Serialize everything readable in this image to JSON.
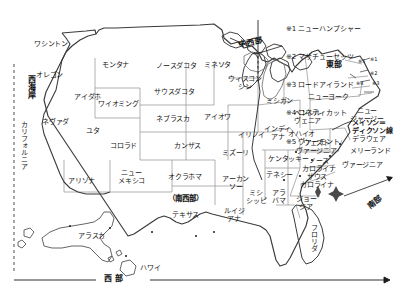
{
  "map": {
    "title_alt": "アメリカ合衆国州地図",
    "legend": {
      "marker_symbol": "※",
      "items": [
        {
          "num": "1",
          "label": "ニューハンプシャー"
        },
        {
          "num": "2",
          "label": "マサチューセッツ"
        },
        {
          "num": "3",
          "label": "ロードアイランド"
        },
        {
          "num": "4",
          "label": "コネティカット"
        },
        {
          "num": "5",
          "label": "ヴァーモント"
        }
      ]
    },
    "regions": [
      {
        "name": "west-coast",
        "label": "西海岸"
      },
      {
        "name": "midwest",
        "label": "中西部"
      },
      {
        "name": "east",
        "label": "東部"
      },
      {
        "name": "southwest",
        "label": "（南西部）"
      },
      {
        "name": "south",
        "label": "南部"
      },
      {
        "name": "west",
        "label": "西部"
      }
    ],
    "annotations": [
      {
        "name": "mason-dixon-line",
        "label": "メイソン＝\nディクソン線"
      }
    ],
    "states": [
      {
        "name": "washington",
        "label": "ワシントン"
      },
      {
        "name": "oregon",
        "label": "オレゴン"
      },
      {
        "name": "idaho",
        "label": "アイダホ"
      },
      {
        "name": "nevada",
        "label": "ネヴァダ"
      },
      {
        "name": "california",
        "label": "カリフォルニア"
      },
      {
        "name": "utah",
        "label": "ユタ"
      },
      {
        "name": "arizona",
        "label": "アリゾナ"
      },
      {
        "name": "montana",
        "label": "モンタナ"
      },
      {
        "name": "wyoming",
        "label": "ワイオミング"
      },
      {
        "name": "colorado",
        "label": "コロラド"
      },
      {
        "name": "new-mexico",
        "label": "ニュー\nメキシコ"
      },
      {
        "name": "north-dakota",
        "label": "ノースダコタ"
      },
      {
        "name": "south-dakota",
        "label": "サウスダコタ"
      },
      {
        "name": "nebraska",
        "label": "ネブラスカ"
      },
      {
        "name": "kansas",
        "label": "カンザス"
      },
      {
        "name": "oklahoma",
        "label": "オクラホマ"
      },
      {
        "name": "texas",
        "label": "テキサス"
      },
      {
        "name": "minnesota",
        "label": "ミネソタ"
      },
      {
        "name": "iowa",
        "label": "アイオワ"
      },
      {
        "name": "missouri",
        "label": "ミズーリ"
      },
      {
        "name": "arkansas",
        "label": "アーカン\nソー"
      },
      {
        "name": "louisiana",
        "label": "ルイジ\nアナ"
      },
      {
        "name": "wisconsin",
        "label": "ウィスコン\nシン"
      },
      {
        "name": "illinois",
        "label": "イリノイ"
      },
      {
        "name": "michigan",
        "label": "ミシガン"
      },
      {
        "name": "indiana",
        "label": "インディ\nアナ"
      },
      {
        "name": "ohio",
        "label": "オハイオ"
      },
      {
        "name": "kentucky",
        "label": "ケンタッキー"
      },
      {
        "name": "tennessee",
        "label": "テネシー"
      },
      {
        "name": "mississippi",
        "label": "ミシ\nシッピ"
      },
      {
        "name": "alabama",
        "label": "アラ\nバマ"
      },
      {
        "name": "georgia",
        "label": "ジョー\nジア"
      },
      {
        "name": "florida",
        "label": "フロリダ"
      },
      {
        "name": "south-carolina",
        "label": "サウス\nカロライナ"
      },
      {
        "name": "north-carolina",
        "label": "ノース\nカロライナ"
      },
      {
        "name": "virginia",
        "label": "ヴァージニア"
      },
      {
        "name": "west-virginia",
        "label": "ウェスト\nヴァージニア"
      },
      {
        "name": "maryland",
        "label": "メリーランド"
      },
      {
        "name": "delaware",
        "label": "デラウェア"
      },
      {
        "name": "pennsylvania",
        "label": "ペンシル\nヴェニア"
      },
      {
        "name": "new-jersey",
        "label": "ニュー\nジャージー"
      },
      {
        "name": "new-york",
        "label": "ニューヨーク"
      },
      {
        "name": "alaska",
        "label": "アラスカ"
      },
      {
        "name": "hawaii",
        "label": "ハワイ"
      }
    ],
    "state_markers": [
      {
        "name": "marker-vermont",
        "label": "※5"
      },
      {
        "name": "marker-new-hampshire",
        "label": "※1"
      },
      {
        "name": "marker-massachusetts",
        "label": "※2"
      },
      {
        "name": "marker-rhode-island",
        "label": "※3"
      },
      {
        "name": "marker-connecticut",
        "label": "※4"
      }
    ],
    "colors": {
      "outline": "#3a3a3a",
      "border_thin": "#8f8f8f",
      "text": "#141414",
      "background": "#ffffff"
    }
  }
}
